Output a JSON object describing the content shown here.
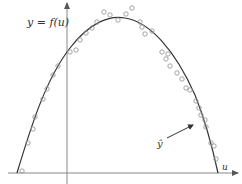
{
  "diagram": {
    "title": "",
    "y_axis_label": "y = f(u)",
    "x_axis_label": "u",
    "fitted_curve_label": "ŷ",
    "colors": {
      "axis": "#777777",
      "curve": "#333333",
      "points": "#888888",
      "text": "#333333"
    }
  },
  "chart_data": {
    "type": "scatter",
    "title": "",
    "xlabel": "u",
    "ylabel": "y = f(u)",
    "annotations": [
      "ŷ"
    ],
    "points_px": [
      [
        22,
        171
      ],
      [
        28,
        143
      ],
      [
        33,
        129
      ],
      [
        35,
        117
      ],
      [
        43,
        99
      ],
      [
        47,
        89
      ],
      [
        53,
        75
      ],
      [
        58,
        66
      ],
      [
        70,
        52
      ],
      [
        76,
        50
      ],
      [
        80,
        40
      ],
      [
        86,
        33
      ],
      [
        92,
        28
      ],
      [
        97,
        22
      ],
      [
        104,
        12
      ],
      [
        110,
        15
      ],
      [
        118,
        20
      ],
      [
        126,
        14
      ],
      [
        132,
        8
      ],
      [
        140,
        22
      ],
      [
        142,
        27
      ],
      [
        145,
        34
      ],
      [
        152,
        31
      ],
      [
        162,
        52
      ],
      [
        166,
        59
      ],
      [
        168,
        54
      ],
      [
        170,
        66
      ],
      [
        177,
        73
      ],
      [
        182,
        79
      ],
      [
        186,
        88
      ],
      [
        190,
        90
      ],
      [
        196,
        101
      ],
      [
        199,
        108
      ],
      [
        201,
        115
      ],
      [
        205,
        120
      ],
      [
        206,
        127
      ],
      [
        211,
        143
      ],
      [
        214,
        146
      ],
      [
        216,
        159
      ]
    ]
  }
}
